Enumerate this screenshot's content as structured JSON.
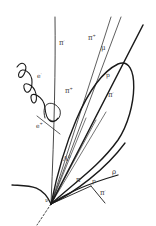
{
  "diagram": {
    "title": "",
    "type": "particle-track-event-sketch",
    "colors": {
      "background": "#ffffff",
      "stroke": "#1a1a1a",
      "label": "#3a3a3a"
    },
    "labels": {
      "pi_vertical": {
        "text": "π",
        "sup": "-"
      },
      "pi_upper": {
        "text": "π",
        "sup": "+"
      },
      "mu": {
        "text": "μ",
        "sup": ""
      },
      "e_spiral": {
        "text": "e",
        "sup": "-"
      },
      "pi_mid": {
        "text": "π",
        "sup": "+"
      },
      "p_in_loop": {
        "text": "p",
        "sup": ""
      },
      "pi_in_loop": {
        "text": "π",
        "sup": "-"
      },
      "e_lower": {
        "text": "e",
        "sup": "+"
      },
      "lambda": {
        "text": "Λ",
        "sup": "0"
      },
      "rho": {
        "text": "ρ",
        "sup": ""
      },
      "pi_bottom": {
        "text": "π",
        "sup": "-"
      },
      "p_vertex": {
        "text": "p",
        "sup": ""
      },
      "pi_branch": {
        "text": "π",
        "sup": "-"
      },
      "nu": {
        "text": "ν",
        "sup": ""
      }
    }
  }
}
